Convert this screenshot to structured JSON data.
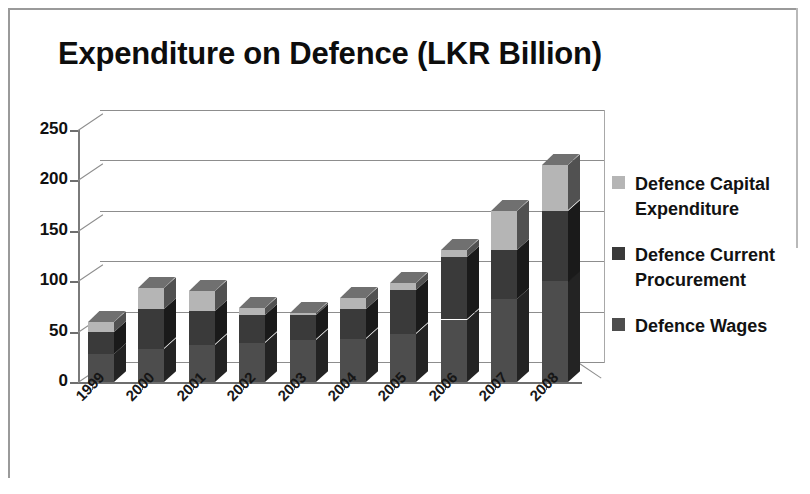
{
  "chart_data": {
    "type": "bar",
    "subtype": "stacked-column-3d",
    "title": "Expenditure on Defence (LKR Billion)",
    "xlabel": "",
    "ylabel": "",
    "ylim": [
      0,
      250
    ],
    "ytick_labels": [
      "0",
      "50",
      "100",
      "150",
      "200",
      "250"
    ],
    "yticks": [
      0,
      50,
      100,
      150,
      200,
      250
    ],
    "grid": true,
    "legend_position": "right",
    "categories": [
      "1999",
      "2000",
      "2001",
      "2002",
      "2003",
      "2004",
      "2005",
      "2006",
      "2007",
      "2008"
    ],
    "series": [
      {
        "name": "Defence Wages",
        "color": "#4d4d4d",
        "values": [
          28,
          33,
          37,
          39,
          42,
          43,
          48,
          62,
          82,
          100
        ]
      },
      {
        "name": "Defence Current Procurement",
        "color": "#3a3a3a",
        "values": [
          22,
          39,
          33,
          27,
          24,
          29,
          43,
          62,
          49,
          70
        ]
      },
      {
        "name": "Defence Capital Expenditure",
        "color": "#b5b5b5",
        "values": [
          10,
          21,
          20,
          7,
          2,
          11,
          7,
          7,
          39,
          45
        ]
      }
    ],
    "totals": [
      60,
      93,
      90,
      73,
      68,
      83,
      98,
      131,
      170,
      215
    ],
    "annotations": []
  },
  "legend": {
    "entries": [
      {
        "label": "Defence Capital Expenditure",
        "color": "#b5b5b5"
      },
      {
        "label": "Defence Current Procurement",
        "color": "#3a3a3a"
      },
      {
        "label": "Defence Wages",
        "color": "#4d4d4d"
      }
    ]
  },
  "colors": {
    "capital": "#b5b5b5",
    "current": "#3a3a3a",
    "wages": "#4d4d4d",
    "axis": "#6e6e6e",
    "grid": "#8d8d8d",
    "text": "#111111",
    "background": "#ffffff"
  }
}
